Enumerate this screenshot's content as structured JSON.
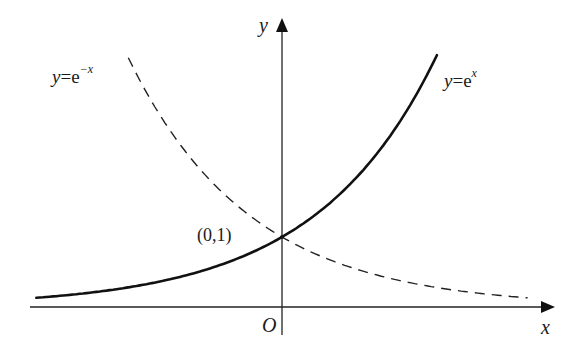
{
  "figure": {
    "type": "function-graph",
    "curves": [
      {
        "name": "exp",
        "label_lhs": "y",
        "label_eq": "=",
        "label_base": "e",
        "label_exp": "x",
        "style": "solid",
        "color": "#111111"
      },
      {
        "name": "exp-neg",
        "label_lhs": "y",
        "label_eq": "=",
        "label_base": "e",
        "label_exp": "−x",
        "style": "dashed",
        "color": "#111111"
      }
    ],
    "axes": {
      "x_label": "x",
      "y_label": "y",
      "origin_label": "O"
    },
    "point": {
      "label": "(0,1)",
      "x": 0,
      "y": 1
    }
  },
  "chart_data": {
    "type": "line",
    "title": "",
    "xlabel": "x",
    "ylabel": "y",
    "series": [
      {
        "name": "y = e^x",
        "style": "solid",
        "x": [
          -2,
          -1.5,
          -1,
          -0.5,
          0,
          0.5,
          1,
          1.28
        ],
        "values": [
          0.135,
          0.223,
          0.368,
          0.607,
          1,
          1.649,
          2.718,
          3.6
        ]
      },
      {
        "name": "y = e^-x",
        "style": "dashed",
        "x": [
          -1.27,
          -1,
          -0.5,
          0,
          0.5,
          1,
          1.5,
          2,
          2.03
        ],
        "values": [
          3.56,
          2.718,
          1.649,
          1,
          0.607,
          0.368,
          0.223,
          0.135,
          0.131
        ]
      }
    ],
    "annotations": [
      "(0,1)",
      "O"
    ],
    "grid": false
  }
}
